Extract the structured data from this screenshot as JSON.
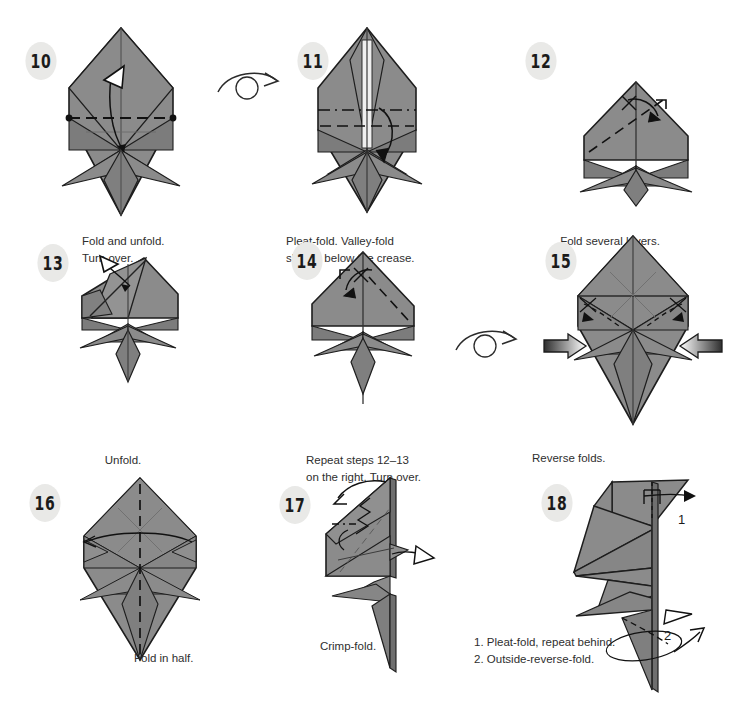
{
  "page": {
    "background_color": "#ffffff",
    "paper_color": "#8b8b8b",
    "paper_shadow_color": "#6f6f6f",
    "paper_light_color": "#a0a0a0",
    "paper_white_color": "#f2f2f2",
    "line_color": "#1d1d1d",
    "badge_bg_color": "#e9e9e7",
    "badge_text_color": "#1b1b1b",
    "caption_text_color": "#2e2e2e"
  },
  "steps": [
    {
      "number": "10",
      "caption": "Fold and unfold.\nTurn over.",
      "caption_align": "left",
      "icons": [
        "hollow-arrow-up",
        "valley-fold-dashed-line",
        "crease-marker-dots"
      ],
      "turn_over_after": true
    },
    {
      "number": "11",
      "caption": "Pleat-fold. Valley-fold\nslightly below the crease.",
      "caption_align": "left",
      "icons": [
        "pleat-fold-dashed-lines",
        "curved-fold-arrow-down"
      ],
      "turn_over_after": false
    },
    {
      "number": "12",
      "caption": "Fold several layers.",
      "caption_align": "center",
      "icons": [
        "valley-fold-dashed-line",
        "fold-arrow-right",
        "repeat-tick-mark"
      ],
      "turn_over_after": false
    },
    {
      "number": "13",
      "caption": "Unfold.",
      "caption_align": "center",
      "icons": [
        "hollow-unfold-arrow"
      ],
      "turn_over_after": false
    },
    {
      "number": "14",
      "caption": "Repeat steps 12–13\non the right. Turn over.",
      "caption_align": "left",
      "icons": [
        "fold-arrow-left",
        "repeat-tick-mark",
        "valley-fold-dashed-line"
      ],
      "turn_over_after": true
    },
    {
      "number": "15",
      "caption": "Reverse folds.",
      "caption_align": "left",
      "icons": [
        "push-arrow-left",
        "push-arrow-right",
        "reverse-fold-arrows"
      ],
      "turn_over_after": false
    },
    {
      "number": "16",
      "caption": "Fold in half.",
      "caption_align": "right",
      "icons": [
        "mountain-fold-dashed-line",
        "fold-in-half-arrow"
      ],
      "turn_over_after": false
    },
    {
      "number": "17",
      "caption": "Crimp-fold.",
      "caption_align": "center",
      "icons": [
        "crimp-fold-arrow",
        "zigzag-crimp-symbol",
        "hollow-arrow-right"
      ],
      "turn_over_after": false
    },
    {
      "number": "18",
      "caption": "1. Pleat-fold, repeat behind.\n2. Outside-reverse-fold.",
      "caption_align": "left",
      "icons": [
        "pleat-arrow-1",
        "outside-reverse-arrow-2",
        "hollow-arrow-right"
      ],
      "labels": [
        "1",
        "2"
      ],
      "turn_over_after": false
    }
  ],
  "turn_over_symbols": [
    {
      "name": "turn-over-arrow-1",
      "between": "10-11"
    },
    {
      "name": "turn-over-arrow-2",
      "between": "14-15"
    }
  ]
}
